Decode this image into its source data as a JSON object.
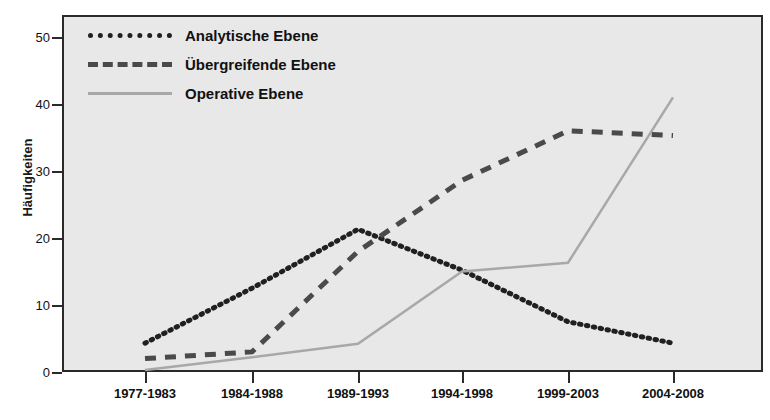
{
  "chart_data": {
    "type": "line",
    "title": "",
    "xlabel": "",
    "ylabel": "Häufigkeiten",
    "categories": [
      "1977-1983",
      "1984-1988",
      "1989-1993",
      "1994-1998",
      "1999-2003",
      "2004-2008"
    ],
    "ylim": [
      0,
      53
    ],
    "yticks": [
      0,
      10,
      20,
      30,
      40,
      50
    ],
    "ytick_labels": [
      "0",
      "10",
      "20",
      "30",
      "40",
      "50"
    ],
    "grid": false,
    "legend_position": "upper-left-inside",
    "series": [
      {
        "name": "Analytische Ebene",
        "style": "dotted",
        "color": "#202020",
        "values": [
          4.3,
          12.5,
          21.3,
          15.2,
          7.5,
          4.3
        ]
      },
      {
        "name": "Übergreifende Ebene",
        "style": "dashed",
        "color": "#4a4a4a",
        "values": [
          2.0,
          3.0,
          18.0,
          28.6,
          36.0,
          35.3
        ]
      },
      {
        "name": "Operative Ebene",
        "style": "solid",
        "color": "#a8a8a8",
        "values": [
          0.3,
          2.2,
          4.2,
          15.0,
          16.3,
          41.0
        ]
      }
    ]
  },
  "axis": {
    "y_title": "Häufigkeiten",
    "y_tick_labels": [
      "50",
      "40",
      "30",
      "20",
      "10",
      "0"
    ],
    "x_tick_labels": [
      "1977-1983",
      "1984-1988",
      "1989-1993",
      "1994-1998",
      "1999-2003",
      "2004-2008"
    ]
  },
  "legend": {
    "items": [
      {
        "label": "Analytische Ebene",
        "swatch": "dotted-line-swatch"
      },
      {
        "label": "Übergreifende Ebene",
        "swatch": "dashed-line-swatch"
      },
      {
        "label": "Operative Ebene",
        "swatch": "solid-line-swatch"
      }
    ]
  },
  "colors": {
    "plot_background": "#e8e8e8",
    "frame": "#2a2a2a",
    "analytische": "#202020",
    "uebergreifende": "#4a4a4a",
    "operative": "#a8a8a8"
  }
}
